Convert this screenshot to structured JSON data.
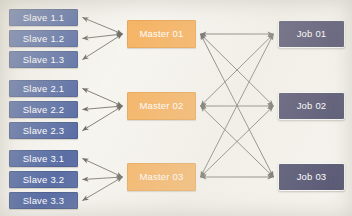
{
  "diagram": {
    "background_color": "#f6f4ef",
    "colors": {
      "slave_fill": "#3e5697",
      "slave_text": "#ffffff",
      "master_fill": "#f5a94e",
      "master_text": "#ffffff",
      "job_fill": "#2d2d54",
      "job_text": "#ffffff",
      "job_border": "#fbfaf6",
      "arrow": "#55524c"
    },
    "groups": [
      {
        "id": "group-1",
        "master": {
          "id": "master-01",
          "label": "Master 01",
          "x": 127,
          "y": 20,
          "w": 69,
          "h": 28
        },
        "slaves": [
          {
            "id": "slave-1-1",
            "label": "Slave 1.1",
            "x": 9,
            "y": 9,
            "w": 69,
            "h": 17
          },
          {
            "id": "slave-1-2",
            "label": "Slave 1.2",
            "x": 9,
            "y": 30,
            "w": 69,
            "h": 17
          },
          {
            "id": "slave-1-3",
            "label": "Slave 1.3",
            "x": 9,
            "y": 51,
            "w": 69,
            "h": 17
          }
        ]
      },
      {
        "id": "group-2",
        "master": {
          "id": "master-02",
          "label": "Master 02",
          "x": 127,
          "y": 92,
          "w": 69,
          "h": 28
        },
        "slaves": [
          {
            "id": "slave-2-1",
            "label": "Slave 2.1",
            "x": 9,
            "y": 80,
            "w": 69,
            "h": 17
          },
          {
            "id": "slave-2-2",
            "label": "Slave 2.2",
            "x": 9,
            "y": 101,
            "w": 69,
            "h": 17
          },
          {
            "id": "slave-2-3",
            "label": "Slave 2.3",
            "x": 9,
            "y": 122,
            "w": 69,
            "h": 17
          }
        ]
      },
      {
        "id": "group-3",
        "master": {
          "id": "master-03",
          "label": "Master 03",
          "x": 127,
          "y": 163,
          "w": 69,
          "h": 28
        },
        "slaves": [
          {
            "id": "slave-3-1",
            "label": "Slave 3.1",
            "x": 9,
            "y": 150,
            "w": 69,
            "h": 17
          },
          {
            "id": "slave-3-2",
            "label": "Slave 3.2",
            "x": 9,
            "y": 171,
            "w": 69,
            "h": 17
          },
          {
            "id": "slave-3-3",
            "label": "Slave 3.3",
            "x": 9,
            "y": 192,
            "w": 69,
            "h": 17
          }
        ]
      }
    ],
    "jobs": [
      {
        "id": "job-01",
        "label": "Job 01",
        "x": 278,
        "y": 20,
        "w": 67,
        "h": 28
      },
      {
        "id": "job-02",
        "label": "Job 02",
        "x": 278,
        "y": 92,
        "w": 67,
        "h": 28
      },
      {
        "id": "job-03",
        "label": "Job 03",
        "x": 278,
        "y": 163,
        "w": 67,
        "h": 28
      }
    ],
    "edges": {
      "slave_master_arrow_style": "double-headed",
      "master_job_arrow_style": "double-headed",
      "master_job_topology": "full-mesh",
      "master_job_pairs": [
        [
          "master-01",
          "job-01"
        ],
        [
          "master-01",
          "job-02"
        ],
        [
          "master-01",
          "job-03"
        ],
        [
          "master-02",
          "job-01"
        ],
        [
          "master-02",
          "job-02"
        ],
        [
          "master-02",
          "job-03"
        ],
        [
          "master-03",
          "job-01"
        ],
        [
          "master-03",
          "job-02"
        ],
        [
          "master-03",
          "job-03"
        ]
      ]
    }
  }
}
